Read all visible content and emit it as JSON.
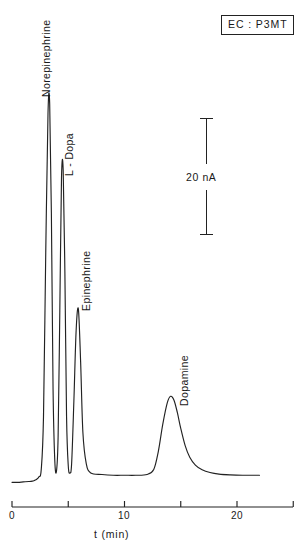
{
  "figure": {
    "width": 303,
    "height": 547,
    "background": "#ffffff",
    "ink_color": "#222222"
  },
  "legend_box": {
    "text": "EC : P3MT",
    "name": "detector-condition-label"
  },
  "scale_bar": {
    "label": "20 nA",
    "value": 20,
    "unit": "nA",
    "orientation": "vertical"
  },
  "axis": {
    "title": "t (min)",
    "tick_values": [
      0,
      5,
      10,
      15,
      20,
      25
    ],
    "tick_labels": [
      "0",
      "",
      "10",
      "",
      "20",
      ""
    ],
    "label_0": "0",
    "label_10": "10",
    "label_20": "20",
    "range": [
      0,
      25
    ],
    "unit": "min"
  },
  "peak_labels": [
    {
      "text": "Norepinephrine"
    },
    {
      "text": "L - Dopa"
    },
    {
      "text": "Epinephrine"
    },
    {
      "text": "Dopamine"
    }
  ],
  "chart_data": {
    "type": "line",
    "title": "",
    "subtitle": "",
    "xlabel": "t (min)",
    "ylabel": "Detector response (nA)",
    "xlim": [
      0,
      25
    ],
    "ylim": [
      0,
      100
    ],
    "grid": false,
    "legend_position": "none",
    "annotations": [
      {
        "text": "EC : P3MT",
        "position": "top-right",
        "boxed": true
      },
      {
        "text": "20 nA",
        "position": "middle-right",
        "type": "scale-bar"
      }
    ],
    "series": [
      {
        "name": "Chromatogram",
        "x": [
          0.0,
          0.5,
          1.0,
          1.5,
          1.8,
          2.0,
          2.2,
          2.4,
          2.6,
          2.8,
          3.0,
          3.2,
          3.35,
          3.5,
          3.65,
          3.8,
          3.95,
          4.1,
          4.25,
          4.4,
          4.55,
          4.7,
          4.85,
          5.0,
          5.15,
          5.3,
          5.5,
          5.7,
          5.9,
          6.1,
          6.3,
          6.6,
          7.0,
          8.0,
          9.0,
          10.0,
          11.0,
          12.0,
          12.6,
          13.0,
          13.4,
          13.8,
          14.1,
          14.4,
          14.7,
          15.0,
          15.4,
          15.8,
          16.3,
          16.9,
          17.6,
          18.4,
          19.4,
          20.5,
          21.5,
          22.0
        ],
        "y": [
          1.2,
          1.2,
          1.3,
          1.4,
          1.5,
          1.7,
          2.0,
          2.6,
          4.5,
          18.0,
          60.0,
          95.5,
          98.0,
          70.0,
          25.0,
          7.0,
          4.0,
          13.0,
          45.0,
          79.0,
          81.0,
          55.0,
          18.0,
          5.5,
          3.6,
          6.0,
          22.0,
          40.0,
          45.5,
          32.0,
          14.0,
          6.0,
          3.6,
          3.2,
          3.0,
          3.0,
          3.0,
          3.2,
          4.5,
          9.0,
          16.0,
          21.5,
          23.2,
          22.2,
          19.0,
          15.0,
          10.5,
          7.6,
          5.6,
          4.4,
          3.7,
          3.3,
          3.1,
          3.0,
          3.0,
          3.0
        ]
      }
    ],
    "peaks": [
      {
        "name": "Norepinephrine",
        "retention_time_min": 3.35,
        "relative_height": 98
      },
      {
        "name": "L - Dopa",
        "retention_time_min": 4.5,
        "relative_height": 81
      },
      {
        "name": "Epinephrine",
        "retention_time_min": 5.9,
        "relative_height": 46
      },
      {
        "name": "Dopamine",
        "retention_time_min": 14.1,
        "relative_height": 23
      }
    ]
  }
}
